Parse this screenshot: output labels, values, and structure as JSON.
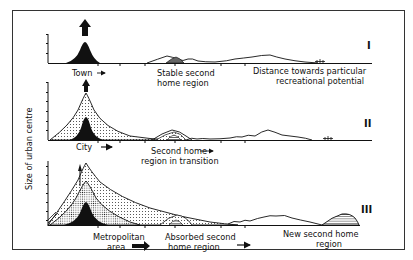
{
  "diagram": {
    "y_axis_label": "Size of urban centre",
    "panels": [
      {
        "numeral": "I",
        "labels": {
          "centre": "Town",
          "second_home_line1": "Stable second",
          "second_home_line2": "home region",
          "distance_line1": "Distance towards particular",
          "distance_line2": "recreational potential"
        }
      },
      {
        "numeral": "II",
        "labels": {
          "centre": "City",
          "second_home_line1": "Second home",
          "second_home_line2": "region in transition"
        }
      },
      {
        "numeral": "III",
        "labels": {
          "centre_line1": "Metropolitan",
          "centre_line2": "area",
          "second_home_line1": "Absorbed second",
          "second_home_line2": "home region",
          "new_line1": "New second home",
          "new_line2": "region"
        }
      }
    ],
    "colors": {
      "ink": "#111111",
      "background": "#ffffff",
      "frame": "#333333"
    }
  }
}
